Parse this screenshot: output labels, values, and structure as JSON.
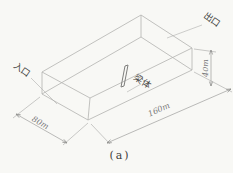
{
  "figure": {
    "caption": "(a)",
    "labels": {
      "inlet": "入口",
      "outlet": "出口",
      "beam": "梁体"
    },
    "dimensions": {
      "width": "80m",
      "length": "160m",
      "height": "40m"
    },
    "colors": {
      "background": "#f8f8f5",
      "box_line": "#b2b2b0",
      "dimension_line": "#9e9e9c",
      "label_text": "#454543",
      "dimension_text": "#78787a"
    }
  }
}
